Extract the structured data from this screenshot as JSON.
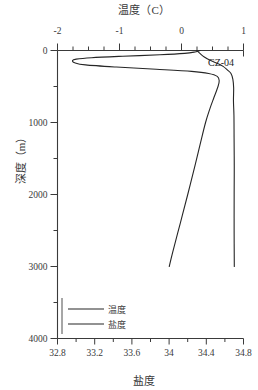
{
  "figure": {
    "annotation": "CZ-04",
    "ink_color": "#3a3a3a",
    "curve_color": "#262626",
    "background": "#ffffff"
  },
  "chart_data": {
    "type": "line",
    "title": "温度（C）",
    "subtitle": "",
    "xlabel": "盐度",
    "xlabel_top": "温度（C）",
    "ylabel": "深度（m）",
    "orientation": "vertical-profile",
    "y_inverted": true,
    "ylim": [
      0,
      4000
    ],
    "yticks": [
      0,
      1000,
      2000,
      3000,
      4000
    ],
    "ytick_labels": [
      "0",
      "1000",
      "2000",
      "3000",
      "4000"
    ],
    "yminor_step": 500,
    "xlim_top": [
      -2,
      1
    ],
    "xticks_top": [
      -2,
      -1,
      0,
      1
    ],
    "xtick_labels_top": [
      "-2",
      "-1",
      "0",
      "1"
    ],
    "xminor_step_top": 0.25,
    "xlim_bottom": [
      32.8,
      34.8
    ],
    "xticks_bottom": [
      32.8,
      33.2,
      33.6,
      34,
      34.4,
      34.8
    ],
    "xtick_labels_bottom": [
      "32.8",
      "33.2",
      "33.6",
      "34",
      "34.4",
      "34.8"
    ],
    "xminor_step_bottom": 0.2,
    "grid": false,
    "legend_position": "lower-left-inside",
    "annotations": [
      {
        "text": "CZ-04",
        "depth_m": 150,
        "note": "station label at upper right"
      }
    ],
    "series": [
      {
        "name": "温度",
        "legend_label": "温度",
        "axis": "top",
        "units": "C",
        "points": [
          {
            "depth_m": 0,
            "value": 0.3
          },
          {
            "depth_m": 20,
            "value": 0.22
          },
          {
            "depth_m": 40,
            "value": 0.05
          },
          {
            "depth_m": 60,
            "value": -0.35
          },
          {
            "depth_m": 80,
            "value": -0.95
          },
          {
            "depth_m": 100,
            "value": -1.45
          },
          {
            "depth_m": 120,
            "value": -1.7
          },
          {
            "depth_m": 140,
            "value": -1.76
          },
          {
            "depth_m": 170,
            "value": -1.72
          },
          {
            "depth_m": 200,
            "value": -1.55
          },
          {
            "depth_m": 230,
            "value": -1.05
          },
          {
            "depth_m": 260,
            "value": -0.4
          },
          {
            "depth_m": 290,
            "value": 0.15
          },
          {
            "depth_m": 320,
            "value": 0.45
          },
          {
            "depth_m": 360,
            "value": 0.58
          },
          {
            "depth_m": 420,
            "value": 0.62
          },
          {
            "depth_m": 500,
            "value": 0.6
          },
          {
            "depth_m": 650,
            "value": 0.52
          },
          {
            "depth_m": 800,
            "value": 0.45
          },
          {
            "depth_m": 1000,
            "value": 0.38
          },
          {
            "depth_m": 1300,
            "value": 0.3
          },
          {
            "depth_m": 1600,
            "value": 0.22
          },
          {
            "depth_m": 2000,
            "value": 0.1
          },
          {
            "depth_m": 2400,
            "value": -0.02
          },
          {
            "depth_m": 2800,
            "value": -0.14
          },
          {
            "depth_m": 3000,
            "value": -0.2
          }
        ]
      },
      {
        "name": "盐度",
        "legend_label": "盐度",
        "axis": "bottom",
        "units": "PSU",
        "points": [
          {
            "depth_m": 0,
            "value": 34.3
          },
          {
            "depth_m": 40,
            "value": 34.33
          },
          {
            "depth_m": 90,
            "value": 34.38
          },
          {
            "depth_m": 140,
            "value": 34.45
          },
          {
            "depth_m": 180,
            "value": 34.52
          },
          {
            "depth_m": 220,
            "value": 34.58
          },
          {
            "depth_m": 270,
            "value": 34.62
          },
          {
            "depth_m": 320,
            "value": 34.66
          },
          {
            "depth_m": 400,
            "value": 34.68
          },
          {
            "depth_m": 520,
            "value": 34.69
          },
          {
            "depth_m": 700,
            "value": 34.7
          },
          {
            "depth_m": 900,
            "value": 34.7
          },
          {
            "depth_m": 1200,
            "value": 34.7
          },
          {
            "depth_m": 1600,
            "value": 34.7
          },
          {
            "depth_m": 2000,
            "value": 34.7
          },
          {
            "depth_m": 2500,
            "value": 34.7
          },
          {
            "depth_m": 3000,
            "value": 34.7
          }
        ]
      }
    ]
  },
  "legend": {
    "entries": [
      {
        "label": "温度"
      },
      {
        "label": "盐度"
      }
    ]
  }
}
